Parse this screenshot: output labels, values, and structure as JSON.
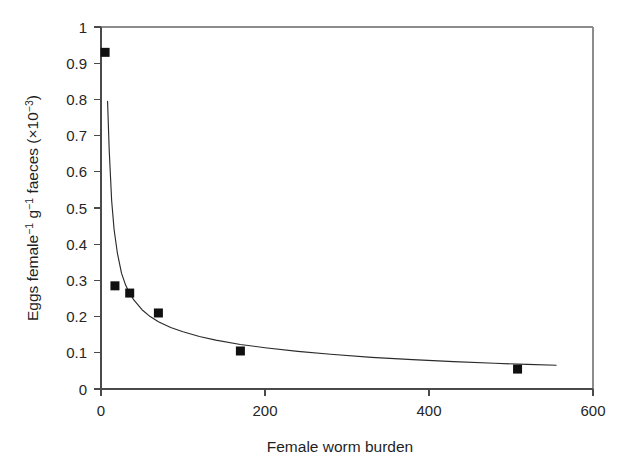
{
  "chart_data": {
    "type": "scatter",
    "title": "",
    "subtitle": "",
    "xlabel": "Female worm burden",
    "ylabel": "Eggs female⁻¹ g⁻¹ faeces (×10⁻³)",
    "ylabel_parts": {
      "text1": "Eggs female",
      "sup1": "−1",
      "text2": " g",
      "sup2": "−1",
      "text3": " faeces (×10",
      "sup3": "−3",
      "text4": ")"
    },
    "xlim": [
      0,
      600
    ],
    "ylim": [
      0,
      1
    ],
    "xticks": [
      0,
      200,
      400,
      600
    ],
    "xtick_labels": [
      "0",
      "200",
      "400",
      "600"
    ],
    "yticks": [
      0,
      0.1,
      0.2,
      0.3,
      0.4,
      0.5,
      0.6,
      0.7,
      0.8,
      0.9,
      1
    ],
    "ytick_labels": [
      "0",
      "0.1",
      "0.2",
      "0.3",
      "0.4",
      "0.5",
      "0.6",
      "0.7",
      "0.8",
      "0.9",
      "1"
    ],
    "grid": false,
    "legend": null,
    "legend_position": "none",
    "marker_style": "filled-square",
    "marker_color": "#101010",
    "curve_color": "#2b2b2b",
    "series": [
      {
        "name": "Observed egg output",
        "type": "scatter",
        "x": [
          5,
          17,
          35,
          70,
          170,
          508
        ],
        "y": [
          0.93,
          0.285,
          0.265,
          0.21,
          0.105,
          0.055
        ],
        "points": [
          {
            "x": 5,
            "y": 0.93
          },
          {
            "x": 17,
            "y": 0.285
          },
          {
            "x": 35,
            "y": 0.265
          },
          {
            "x": 70,
            "y": 0.21
          },
          {
            "x": 170,
            "y": 0.105
          },
          {
            "x": 508,
            "y": 0.055
          }
        ]
      },
      {
        "name": "Fitted density-dependence curve",
        "type": "line",
        "x": [
          8,
          10,
          13,
          16,
          20,
          25,
          30,
          35,
          40,
          50,
          60,
          70,
          85,
          100,
          120,
          140,
          170,
          200,
          240,
          280,
          330,
          380,
          430,
          480,
          520,
          555
        ],
        "y": [
          0.795,
          0.66,
          0.52,
          0.44,
          0.375,
          0.32,
          0.287,
          0.264,
          0.246,
          0.219,
          0.2,
          0.186,
          0.17,
          0.158,
          0.145,
          0.135,
          0.123,
          0.114,
          0.104,
          0.096,
          0.0875,
          0.081,
          0.0755,
          0.071,
          0.068,
          0.0655
        ]
      }
    ],
    "annotations": []
  },
  "axes": {
    "x_axis_name": "x-axis",
    "y_axis_name": "y-axis"
  }
}
